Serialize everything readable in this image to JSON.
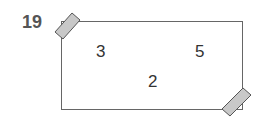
{
  "question": {
    "number": "19"
  },
  "card": {
    "numbers": [
      {
        "label": "3",
        "position": "top-left"
      },
      {
        "label": "5",
        "position": "top-right"
      },
      {
        "label": "2",
        "position": "bottom-center"
      }
    ],
    "tape_color": "#c8c8c8"
  }
}
